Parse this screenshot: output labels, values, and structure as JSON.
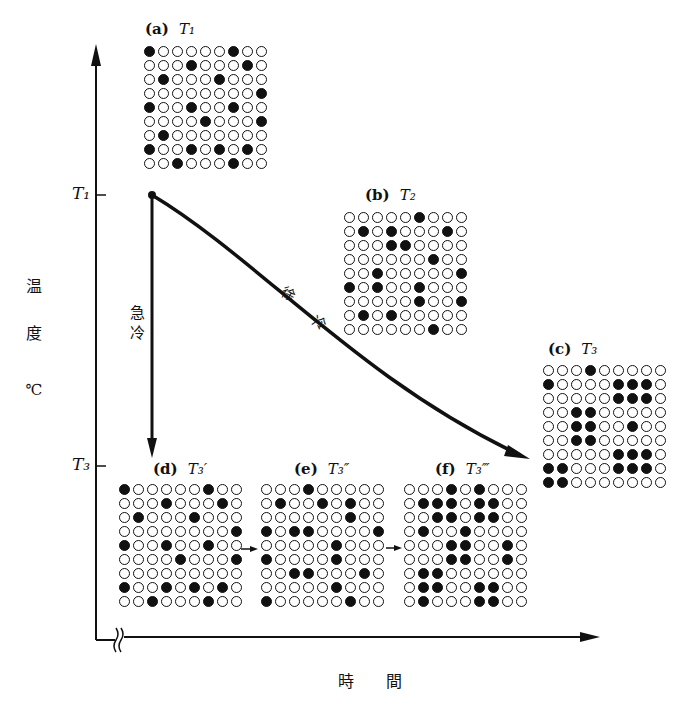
{
  "figure": {
    "y_axis": {
      "label_chars": [
        "温",
        "度"
      ],
      "unit": "℃",
      "ticks": [
        {
          "label": "T₁",
          "y": 195
        },
        {
          "label": "T₃",
          "y": 466
        }
      ]
    },
    "x_axis": {
      "label": "時　　間",
      "break_mark": true
    },
    "paths": {
      "quench": {
        "label_chars": [
          "急",
          "冷"
        ]
      },
      "slow_cool": {
        "label_chars": [
          "徐",
          "冷"
        ]
      }
    },
    "panels": [
      {
        "id": "a",
        "label": "(a)",
        "temp": "T₁",
        "grid": [
          [
            1,
            0,
            0,
            0,
            0,
            0,
            1,
            0,
            0
          ],
          [
            0,
            0,
            0,
            1,
            0,
            0,
            0,
            1,
            0
          ],
          [
            0,
            1,
            0,
            0,
            0,
            1,
            0,
            0,
            0
          ],
          [
            0,
            0,
            0,
            0,
            0,
            0,
            0,
            0,
            1
          ],
          [
            1,
            0,
            0,
            1,
            0,
            0,
            1,
            0,
            0
          ],
          [
            0,
            0,
            0,
            0,
            1,
            0,
            0,
            0,
            1
          ],
          [
            0,
            1,
            0,
            0,
            0,
            0,
            0,
            0,
            0
          ],
          [
            1,
            0,
            0,
            1,
            0,
            1,
            0,
            1,
            0
          ],
          [
            0,
            0,
            1,
            0,
            0,
            0,
            1,
            0,
            0
          ]
        ]
      },
      {
        "id": "b",
        "label": "(b)",
        "temp": "T₂",
        "grid": [
          [
            0,
            0,
            0,
            0,
            0,
            1,
            0,
            0,
            0
          ],
          [
            0,
            1,
            0,
            1,
            0,
            0,
            0,
            1,
            0
          ],
          [
            0,
            0,
            0,
            1,
            1,
            0,
            0,
            0,
            0
          ],
          [
            0,
            0,
            0,
            0,
            0,
            0,
            1,
            0,
            0
          ],
          [
            0,
            0,
            1,
            0,
            0,
            0,
            0,
            0,
            1
          ],
          [
            1,
            0,
            1,
            0,
            0,
            1,
            0,
            0,
            0
          ],
          [
            0,
            0,
            0,
            0,
            0,
            1,
            0,
            0,
            1
          ],
          [
            0,
            1,
            0,
            1,
            0,
            0,
            0,
            0,
            0
          ],
          [
            0,
            0,
            0,
            0,
            0,
            0,
            1,
            0,
            0
          ]
        ]
      },
      {
        "id": "c",
        "label": "(c)",
        "temp": "T₃",
        "grid": [
          [
            0,
            0,
            0,
            1,
            0,
            0,
            0,
            0,
            0
          ],
          [
            1,
            0,
            0,
            0,
            0,
            1,
            1,
            1,
            0
          ],
          [
            0,
            0,
            0,
            0,
            0,
            1,
            1,
            1,
            0
          ],
          [
            0,
            0,
            1,
            1,
            0,
            0,
            0,
            0,
            0
          ],
          [
            0,
            0,
            1,
            1,
            0,
            0,
            1,
            0,
            0
          ],
          [
            0,
            0,
            1,
            1,
            0,
            0,
            0,
            0,
            0
          ],
          [
            0,
            0,
            0,
            0,
            0,
            1,
            1,
            1,
            0
          ],
          [
            1,
            1,
            0,
            0,
            0,
            1,
            1,
            1,
            0
          ],
          [
            1,
            1,
            0,
            0,
            0,
            0,
            0,
            0,
            0
          ]
        ]
      },
      {
        "id": "d",
        "label": "(d)",
        "temp": "T₃′",
        "grid": [
          [
            1,
            0,
            0,
            0,
            0,
            0,
            1,
            0,
            0
          ],
          [
            0,
            0,
            0,
            1,
            0,
            0,
            0,
            1,
            0
          ],
          [
            0,
            1,
            0,
            0,
            0,
            1,
            0,
            0,
            0
          ],
          [
            0,
            0,
            0,
            0,
            0,
            0,
            0,
            0,
            1
          ],
          [
            1,
            0,
            0,
            1,
            0,
            0,
            1,
            0,
            0
          ],
          [
            0,
            0,
            0,
            0,
            1,
            0,
            0,
            0,
            1
          ],
          [
            0,
            0,
            0,
            0,
            0,
            0,
            0,
            0,
            0
          ],
          [
            1,
            0,
            0,
            1,
            0,
            1,
            0,
            1,
            0
          ],
          [
            0,
            0,
            1,
            0,
            0,
            0,
            1,
            0,
            0
          ]
        ]
      },
      {
        "id": "e",
        "label": "(e)",
        "temp": "T₃″",
        "grid": [
          [
            0,
            0,
            0,
            1,
            0,
            0,
            0,
            0,
            0
          ],
          [
            0,
            1,
            0,
            0,
            1,
            0,
            1,
            0,
            0
          ],
          [
            0,
            0,
            0,
            0,
            0,
            0,
            1,
            0,
            0
          ],
          [
            1,
            0,
            1,
            1,
            0,
            0,
            0,
            0,
            1
          ],
          [
            0,
            0,
            0,
            0,
            0,
            1,
            0,
            0,
            0
          ],
          [
            1,
            0,
            0,
            0,
            0,
            1,
            0,
            0,
            0
          ],
          [
            0,
            0,
            1,
            1,
            0,
            0,
            0,
            1,
            0
          ],
          [
            0,
            0,
            0,
            0,
            0,
            1,
            0,
            0,
            0
          ],
          [
            1,
            0,
            0,
            0,
            0,
            0,
            1,
            0,
            0
          ]
        ]
      },
      {
        "id": "f",
        "label": "(f)",
        "temp": "T₃‴",
        "grid": [
          [
            0,
            0,
            0,
            1,
            0,
            1,
            0,
            0,
            0
          ],
          [
            0,
            1,
            1,
            1,
            0,
            1,
            1,
            0,
            0
          ],
          [
            0,
            0,
            1,
            1,
            0,
            1,
            1,
            0,
            0
          ],
          [
            0,
            1,
            0,
            0,
            1,
            0,
            0,
            0,
            0
          ],
          [
            0,
            0,
            0,
            1,
            1,
            0,
            0,
            1,
            0
          ],
          [
            0,
            0,
            0,
            1,
            1,
            0,
            0,
            1,
            0
          ],
          [
            0,
            1,
            1,
            0,
            0,
            0,
            0,
            0,
            0
          ],
          [
            0,
            1,
            1,
            0,
            0,
            1,
            1,
            0,
            0
          ],
          [
            0,
            1,
            0,
            0,
            0,
            1,
            1,
            0,
            0
          ]
        ]
      }
    ]
  }
}
